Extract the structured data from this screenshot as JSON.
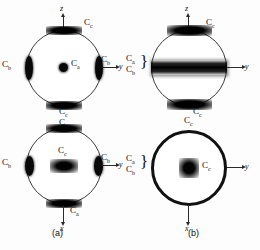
{
  "figure": {
    "width": 260,
    "height": 250,
    "background": "#fdfdfd",
    "ink": "#090909"
  },
  "captions": [
    {
      "id": "a",
      "text": "(a)"
    },
    {
      "id": "b",
      "text": "(b)"
    }
  ],
  "panels": [
    {
      "id": "a-top",
      "column": "a",
      "row": "top",
      "vertical_axis": {
        "label": "z",
        "direction": "up"
      },
      "horizontal_axis": {
        "label": "y",
        "direction": "right"
      },
      "labels": {
        "top": "C",
        "top_sub": "c",
        "left": "C",
        "left_sub": "b",
        "center": "C",
        "center_sub": "a",
        "right": "C",
        "right_sub": "b",
        "bottom": "C",
        "bottom_sub": "c"
      },
      "features": [
        {
          "name": "center-maximum",
          "kind": "dot"
        },
        {
          "name": "left-rim-lens",
          "kind": "lens-v"
        },
        {
          "name": "right-rim-lens",
          "kind": "lens-v"
        },
        {
          "name": "top-rim-cap",
          "kind": "cap"
        },
        {
          "name": "bottom-rim-cap",
          "kind": "cap"
        }
      ]
    },
    {
      "id": "a-bottom",
      "column": "a",
      "row": "bottom",
      "vertical_axis": {
        "label": "x",
        "direction": "down"
      },
      "horizontal_axis": {
        "label": "y",
        "direction": "right"
      },
      "labels": {
        "top": "C",
        "top_sub": "a",
        "left": "C",
        "left_sub": "b",
        "center": "C",
        "center_sub": "c",
        "right": "C",
        "right_sub": "b",
        "bottom": "C",
        "bottom_sub": "a"
      },
      "features": [
        {
          "name": "center-lens",
          "kind": "lens-h"
        },
        {
          "name": "left-rim-lens",
          "kind": "lens-v"
        },
        {
          "name": "right-rim-lens",
          "kind": "lens-v"
        },
        {
          "name": "top-rim-cap",
          "kind": "cap"
        },
        {
          "name": "bottom-rim-cap",
          "kind": "cap"
        }
      ]
    },
    {
      "id": "b-top",
      "column": "b",
      "row": "top",
      "vertical_axis": {
        "label": "z",
        "direction": "up"
      },
      "horizontal_axis": {
        "label": "y",
        "direction": "right"
      },
      "labels": {
        "top": "C",
        "top_sub": "c",
        "bottom": "C",
        "bottom_sub": "c",
        "group_upper": "C",
        "group_upper_sub": "a",
        "group_lower": "C",
        "group_lower_sub": "b",
        "group_brace": "}"
      },
      "features": [
        {
          "name": "equatorial-band",
          "kind": "band"
        },
        {
          "name": "top-rim-cap",
          "kind": "cap"
        },
        {
          "name": "bottom-rim-cap",
          "kind": "cap"
        }
      ]
    },
    {
      "id": "b-bottom",
      "column": "b",
      "row": "bottom",
      "vertical_axis": {
        "label": "x",
        "direction": "down"
      },
      "horizontal_axis": {
        "label": "y",
        "direction": "right"
      },
      "labels": {
        "top": "C",
        "top_sub": "c",
        "center": "C",
        "center_sub": "c",
        "group_upper": "C",
        "group_upper_sub": "a",
        "group_lower": "C",
        "group_lower_sub": "b",
        "group_brace": "}"
      },
      "features": [
        {
          "name": "full-rim-ring",
          "kind": "ring"
        },
        {
          "name": "center-maximum",
          "kind": "dot"
        }
      ]
    }
  ]
}
